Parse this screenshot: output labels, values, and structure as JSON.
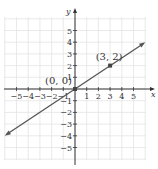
{
  "chart_data": {
    "type": "line",
    "title": "",
    "xlabel": "x",
    "ylabel": "y",
    "xlim": [
      -6,
      6
    ],
    "ylim": [
      -6,
      6
    ],
    "grid": true,
    "x_ticks": [
      -5,
      -4,
      -3,
      -2,
      -1,
      1,
      2,
      3,
      4,
      5
    ],
    "y_ticks": [
      -5,
      -4,
      -3,
      -2,
      -1,
      1,
      2,
      3,
      4,
      5
    ],
    "x_tick_labels": [
      "−5",
      "−4",
      "−3",
      "−2",
      "−1",
      "1",
      "2",
      "3",
      "4",
      "5"
    ],
    "y_tick_labels": [
      "−5",
      "−4",
      "−3",
      "−2",
      "−1",
      "1",
      "2",
      "3",
      "4",
      "5"
    ],
    "series": [
      {
        "name": "y = (2/3)x",
        "equation": "y = 2x/3",
        "slope": 0.6667,
        "intercept": 0,
        "x": [
          -6,
          6
        ],
        "y": [
          -4,
          4
        ],
        "arrows": "both"
      }
    ],
    "points": [
      {
        "x": 0,
        "y": 0,
        "label": "(0, 0)"
      },
      {
        "x": 3,
        "y": 2,
        "label": "(3, 2)"
      }
    ],
    "colors": {
      "line": "#555555",
      "axes": "#333333",
      "grid": "#e4e4e4",
      "point": "#444444"
    }
  }
}
